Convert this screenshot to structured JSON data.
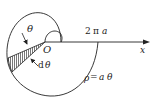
{
  "diagram": {
    "type": "archimedean-spiral-area",
    "labels": {
      "theta": "θ",
      "origin": "O",
      "dtheta_d": "d",
      "dtheta_theta": "θ",
      "crossing_num": "2",
      "crossing_pi": "π",
      "crossing_a": "a",
      "axis": "x",
      "equation_rho": "ρ",
      "equation_eq": "=",
      "equation_a": "a",
      "equation_theta": "θ"
    },
    "colors": {
      "stroke": "#222222",
      "hatch": "#555555",
      "background": "#ffffff"
    }
  }
}
